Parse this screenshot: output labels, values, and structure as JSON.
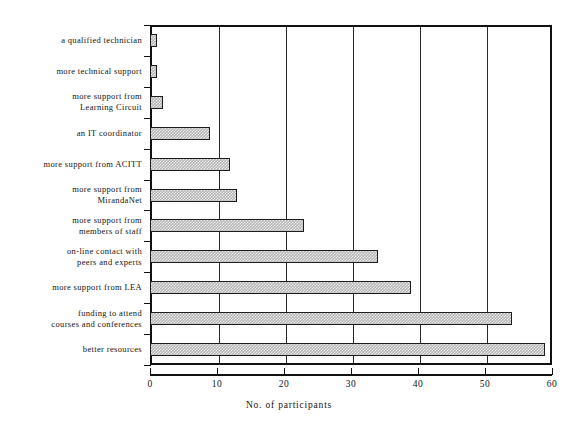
{
  "chart_data": {
    "type": "bar",
    "orientation": "horizontal",
    "title": "",
    "xlabel": "No. of participants",
    "ylabel": "",
    "xlim": [
      0,
      60
    ],
    "xticks": [
      0,
      10,
      20,
      30,
      40,
      50,
      60
    ],
    "grid": true,
    "grid_axis": "x",
    "legend": false,
    "bar_color": "#b4b4b4",
    "bar_edge_color": "#1d1d1d",
    "categories": [
      "a qualified technician",
      "more technical support",
      "more support from\nLearning Circuit",
      "an IT coordinator",
      "more support from  ACITT",
      "more support from\nMirandaNet",
      "more support from\nmembers of staff",
      "on-line contact with\npeers and experts",
      "more support from  LEA",
      "funding to attend\ncourses and conferences",
      "better resources"
    ],
    "values": [
      1,
      1,
      2,
      9,
      12,
      13,
      23,
      34,
      39,
      54,
      59
    ],
    "bars": [
      {
        "label_line1": "a qualified technician",
        "label_line2": "",
        "value": 1
      },
      {
        "label_line1": "more technical support",
        "label_line2": "",
        "value": 1
      },
      {
        "label_line1": "more support from",
        "label_line2": "Learning Circuit",
        "value": 2
      },
      {
        "label_line1": "an IT coordinator",
        "label_line2": "",
        "value": 9
      },
      {
        "label_line1": "more support from  ACITT",
        "label_line2": "",
        "value": 12
      },
      {
        "label_line1": "more support from",
        "label_line2": "MirandaNet",
        "value": 13
      },
      {
        "label_line1": "more support from",
        "label_line2": "members of staff",
        "value": 23
      },
      {
        "label_line1": "on-line contact with",
        "label_line2": "peers and experts",
        "value": 34
      },
      {
        "label_line1": "more support from  LEA",
        "label_line2": "",
        "value": 39
      },
      {
        "label_line1": "funding to attend",
        "label_line2": "courses and conferences",
        "value": 54
      },
      {
        "label_line1": "better resources",
        "label_line2": "",
        "value": 59
      }
    ]
  }
}
